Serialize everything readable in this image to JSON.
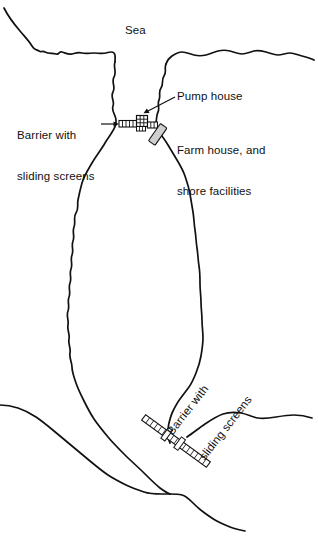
{
  "figure": {
    "kind": "coastal-lagoon-plan-diagram",
    "background_color": "#ffffff",
    "line_color": "#111111",
    "fill_color": "#ffffff",
    "structure_fill": "#ffffff",
    "building_fill": "#cfcfcf"
  },
  "labels": {
    "sea": "Sea",
    "barrier_top_line1": "Barrier with",
    "barrier_top_line2": "sliding screens",
    "pump_house": "Pump house",
    "farm_house_line1": "Farm house, and",
    "farm_house_line2": "shore facilities",
    "barrier_bottom_line1": "Barrier with",
    "barrier_bottom_line2": "sliding screens"
  },
  "features": [
    {
      "name": "sea",
      "type": "water-region",
      "position": "top"
    },
    {
      "name": "lagoon",
      "type": "water-region",
      "position": "center"
    },
    {
      "name": "north-barrier",
      "type": "barrier-with-sliding-screens",
      "orientation": "horizontal",
      "x": 121,
      "y": 122
    },
    {
      "name": "south-barrier",
      "type": "barrier-with-sliding-screens",
      "orientation": "diagonal",
      "x": 176,
      "y": 440
    },
    {
      "name": "pump-house",
      "type": "building-crosshatched",
      "x": 137,
      "y": 116
    },
    {
      "name": "farm-house",
      "type": "building-solid",
      "x": 158,
      "y": 134
    }
  ]
}
